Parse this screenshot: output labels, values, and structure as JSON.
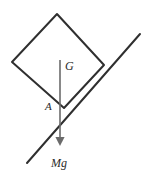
{
  "figure": {
    "background_color": "#ffffff",
    "width": 148,
    "height": 175
  },
  "colors": {
    "outline": "#2f2f2f",
    "incline": "#2f2f2f",
    "force_vector": "#6b6b6b",
    "label": "#2b2b2b"
  },
  "labels": {
    "center_of_gravity": "G",
    "contact_point": "A",
    "weight_force": "Mg"
  },
  "shapes": {
    "block": {
      "name": "square-block",
      "points": "57,14 104,65 64,108 12,62",
      "stroke_width": 2.0
    },
    "incline": {
      "name": "inclined-plane-line",
      "x1": 27,
      "y1": 163,
      "x2": 140,
      "y2": 34,
      "stroke_width": 2.0
    },
    "weight_vector": {
      "name": "weight-arrow",
      "x": 60,
      "y_start": 60,
      "y_end": 148,
      "stroke_width": 1.6,
      "arrow_half_width": 4.5,
      "arrow_length": 9
    }
  },
  "label_positions": {
    "G": {
      "x": 65,
      "y": 70
    },
    "A": {
      "x": 45,
      "y": 110
    },
    "Mg": {
      "x": 51,
      "y": 167
    }
  }
}
